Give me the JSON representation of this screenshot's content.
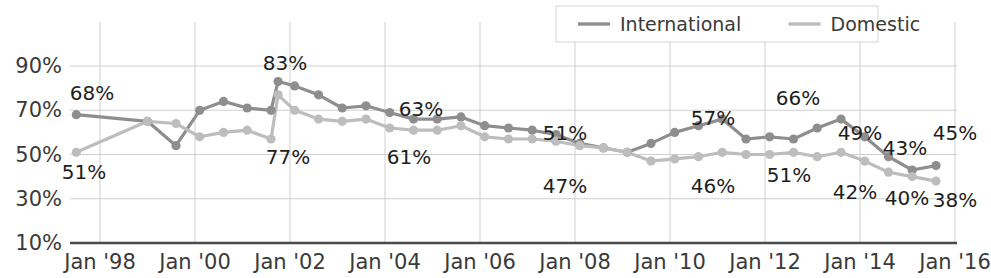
{
  "chart_data": {
    "type": "line",
    "title": "",
    "subtitle": "",
    "xlabel": "",
    "ylabel": "",
    "ylim": [
      10,
      100
    ],
    "yticks": [
      "10%",
      "30%",
      "50%",
      "70%",
      "90%"
    ],
    "ytick_values": [
      10,
      30,
      50,
      70,
      90
    ],
    "xticks": [
      "Jan '98",
      "Jan '00",
      "Jan '02",
      "Jan '04",
      "Jan '06",
      "Jan '08",
      "Jan '10",
      "Jan '12",
      "Jan '14",
      "Jan '16"
    ],
    "xtick_values": [
      1998,
      2000,
      2002,
      2004,
      2006,
      2008,
      2010,
      2012,
      2014,
      2016
    ],
    "grid": true,
    "legend_position": "top-right",
    "colors": {
      "international": "#8e8e8e",
      "domestic": "#bdbdbd",
      "axis": "#4a4a4a",
      "grid": "#cfcfcf",
      "label_text": "#1e1e1e",
      "tick_text": "#3a3a3a",
      "background": "#ffffff"
    },
    "series": [
      {
        "name": "International",
        "color": "#8e8e8e",
        "x": [
          1997.5,
          1999.0,
          1999.6,
          2000.1,
          2000.6,
          2001.1,
          2001.6,
          2001.75,
          2002.1,
          2002.6,
          2003.1,
          2003.6,
          2004.1,
          2004.6,
          2005.1,
          2005.6,
          2006.1,
          2006.6,
          2007.1,
          2007.6,
          2008.1,
          2008.6,
          2009.1,
          2009.6,
          2010.1,
          2010.6,
          2011.1,
          2011.6,
          2012.1,
          2012.6,
          2013.1,
          2013.6,
          2014.1,
          2014.6,
          2015.1,
          2015.6
        ],
        "values": [
          68,
          65,
          54,
          70,
          74,
          71,
          70,
          83,
          81,
          77,
          71,
          72,
          69,
          66,
          66,
          67,
          63,
          62,
          61,
          59,
          55,
          53,
          51,
          55,
          60,
          63,
          66,
          57,
          58,
          57,
          62,
          66,
          58,
          49,
          43,
          45
        ]
      },
      {
        "name": "Domestic",
        "color": "#bdbdbd",
        "x": [
          1997.5,
          1999.0,
          1999.6,
          2000.1,
          2000.6,
          2001.1,
          2001.6,
          2001.75,
          2002.1,
          2002.6,
          2003.1,
          2003.6,
          2004.1,
          2004.6,
          2005.1,
          2005.6,
          2006.1,
          2006.6,
          2007.1,
          2007.6,
          2008.1,
          2008.6,
          2009.1,
          2009.6,
          2010.1,
          2010.6,
          2011.1,
          2011.6,
          2012.1,
          2012.6,
          2013.1,
          2013.6,
          2014.1,
          2014.6,
          2015.1,
          2015.6
        ],
        "values": [
          51,
          65,
          64,
          58,
          60,
          61,
          57,
          77,
          70,
          66,
          65,
          66,
          62,
          61,
          61,
          63,
          58,
          57,
          57,
          56,
          54,
          53,
          51,
          47,
          48,
          49,
          51,
          50,
          50,
          51,
          49,
          51,
          47,
          42,
          40,
          38
        ]
      }
    ],
    "annotations": [
      {
        "text": "68%",
        "series": "International",
        "value": 68,
        "x_px": 92,
        "y_px": 100,
        "anchor": "middle"
      },
      {
        "text": "51%",
        "series": "Domestic",
        "value": 51,
        "x_px": 84,
        "y_px": 179,
        "anchor": "middle"
      },
      {
        "text": "83%",
        "series": "International",
        "value": 83,
        "x_px": 285,
        "y_px": 70,
        "anchor": "middle"
      },
      {
        "text": "77%",
        "series": "Domestic",
        "value": 77,
        "x_px": 288,
        "y_px": 164,
        "anchor": "middle"
      },
      {
        "text": "63%",
        "series": "International",
        "value": 63,
        "x_px": 421,
        "y_px": 116,
        "anchor": "middle"
      },
      {
        "text": "61%",
        "series": "Domestic",
        "value": 61,
        "x_px": 409,
        "y_px": 164,
        "anchor": "middle"
      },
      {
        "text": "51%",
        "series": "International",
        "value": 51,
        "x_px": 565,
        "y_px": 140,
        "anchor": "middle"
      },
      {
        "text": "47%",
        "series": "Domestic",
        "value": 47,
        "x_px": 565,
        "y_px": 193,
        "anchor": "middle"
      },
      {
        "text": "57%",
        "series": "International",
        "value": 57,
        "x_px": 713,
        "y_px": 125,
        "anchor": "middle"
      },
      {
        "text": "46%",
        "series": "Domestic",
        "value": 46,
        "x_px": 713,
        "y_px": 193,
        "anchor": "middle"
      },
      {
        "text": "66%",
        "series": "International",
        "value": 66,
        "x_px": 798,
        "y_px": 105,
        "anchor": "middle"
      },
      {
        "text": "51%",
        "series": "Domestic",
        "value": 51,
        "x_px": 789,
        "y_px": 182,
        "anchor": "middle"
      },
      {
        "text": "49%",
        "series": "International",
        "value": 49,
        "x_px": 860,
        "y_px": 140,
        "anchor": "middle"
      },
      {
        "text": "42%",
        "series": "Domestic",
        "value": 42,
        "x_px": 855,
        "y_px": 199,
        "anchor": "middle"
      },
      {
        "text": "43%",
        "series": "International",
        "value": 43,
        "x_px": 905,
        "y_px": 155,
        "anchor": "middle"
      },
      {
        "text": "40%",
        "series": "Domestic",
        "value": 40,
        "x_px": 907,
        "y_px": 205,
        "anchor": "middle"
      },
      {
        "text": "45%",
        "series": "International",
        "value": 45,
        "x_px": 955,
        "y_px": 140,
        "anchor": "middle"
      },
      {
        "text": "38%",
        "series": "Domestic",
        "value": 38,
        "x_px": 955,
        "y_px": 207,
        "anchor": "middle"
      }
    ]
  },
  "legend": {
    "items": [
      {
        "label": "International",
        "color": "#8e8e8e"
      },
      {
        "label": "Domestic",
        "color": "#bdbdbd"
      }
    ]
  }
}
